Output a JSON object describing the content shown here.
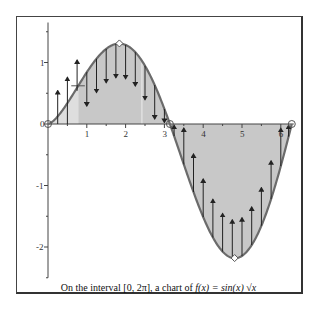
{
  "chart_data": {
    "type": "line",
    "title": "",
    "caption": {
      "prefix": "On the interval",
      "interval": "[0, 2π]",
      "middle": ", a chart of",
      "function": "f(x) = sin(x) √x"
    },
    "function": "sin(x)*sqrt(x)",
    "xlabel": "",
    "ylabel": "",
    "xlim": [
      0,
      6.2832
    ],
    "ylim": [
      -2.5,
      1.65
    ],
    "x_ticks": [
      1,
      2,
      3,
      4,
      5,
      6
    ],
    "x_tick_labels": [
      "1",
      "2",
      "3",
      "4",
      "5",
      "6"
    ],
    "y_ticks": [
      1,
      0,
      -1,
      -2
    ],
    "y_tick_labels": [
      "1",
      "0",
      "-1",
      "-2"
    ],
    "grid": false,
    "legend": null,
    "shaded_area": "between curve and x-axis",
    "inflection_shading_boundary": 0.78,
    "markers": [
      {
        "x": 0,
        "y": 0,
        "kind": "zero"
      },
      {
        "x": 1.84,
        "y": 1.31,
        "kind": "maximum"
      },
      {
        "x": 3.1416,
        "y": 0,
        "kind": "zero"
      },
      {
        "x": 4.81,
        "y": -2.18,
        "kind": "minimum"
      },
      {
        "x": 6.2832,
        "y": 0,
        "kind": "zero"
      }
    ],
    "sample_points": [
      {
        "x": 0.0,
        "y": 0.0
      },
      {
        "x": 0.5,
        "y": 0.34
      },
      {
        "x": 1.0,
        "y": 0.84
      },
      {
        "x": 1.5,
        "y": 1.22
      },
      {
        "x": 2.0,
        "y": 1.29
      },
      {
        "x": 2.5,
        "y": 0.95
      },
      {
        "x": 3.0,
        "y": 0.24
      },
      {
        "x": 3.5,
        "y": -0.66
      },
      {
        "x": 4.0,
        "y": -1.51
      },
      {
        "x": 4.5,
        "y": -2.07
      },
      {
        "x": 5.0,
        "y": -2.14
      },
      {
        "x": 5.5,
        "y": -1.65
      },
      {
        "x": 6.0,
        "y": -0.68
      },
      {
        "x": 6.2832,
        "y": 0.0
      }
    ],
    "arrow_x_positions": [
      0.25,
      0.5,
      0.75,
      1.0,
      1.25,
      1.5,
      1.75,
      2.0,
      2.25,
      2.5,
      2.75,
      3.0,
      3.25,
      3.5,
      3.75,
      4.0,
      4.25,
      4.5,
      4.75,
      5.0,
      5.25,
      5.5,
      5.75,
      6.0,
      6.2
    ]
  },
  "colors": {
    "curve": "#6b6b6b",
    "fill_dark": "#c8c8c8",
    "fill_light": "#dedede",
    "axis": "#444444",
    "arrow": "#222222",
    "frame": "#444444"
  }
}
